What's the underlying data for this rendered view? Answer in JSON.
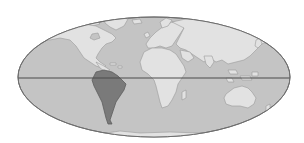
{
  "map": {
    "projection": "mollweide",
    "highlighted_region": "South America",
    "colors": {
      "background": "#ffffff",
      "ocean": "#c4c4c4",
      "land": "#e2e2e2",
      "land_outline": "#9a9a9a",
      "highlight": "#7a7a7a",
      "highlight_outline": "#5e5e5e",
      "border": "#6e6e6e",
      "equator": "#4a4a4a"
    },
    "regions": [
      {
        "name": "North America",
        "highlighted": false
      },
      {
        "name": "South America",
        "highlighted": true
      },
      {
        "name": "Europe",
        "highlighted": false
      },
      {
        "name": "Africa",
        "highlighted": false
      },
      {
        "name": "Asia",
        "highlighted": false
      },
      {
        "name": "Australia",
        "highlighted": false
      },
      {
        "name": "Greenland",
        "highlighted": false
      },
      {
        "name": "Antarctica",
        "highlighted": false
      }
    ],
    "lines": [
      {
        "name": "Equator"
      }
    ]
  }
}
